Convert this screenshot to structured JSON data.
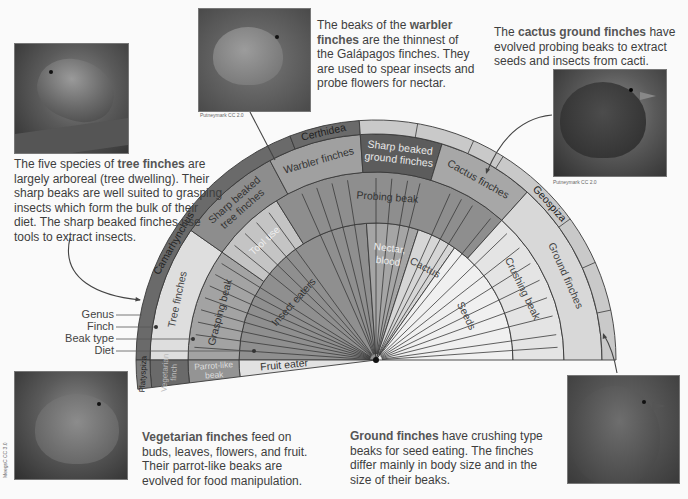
{
  "figure": {
    "center": {
      "x": 376,
      "y": 360
    },
    "rings": {
      "outer": 240,
      "genus_inner": 226,
      "finch_inner": 188,
      "beak_inner": 137
    },
    "legend": [
      {
        "label": "Genus"
      },
      {
        "label": "Finch"
      },
      {
        "label": "Beak type"
      },
      {
        "label": "Diet"
      }
    ],
    "genus": [
      {
        "label": "Camarhynchus",
        "start": 180,
        "end": 111,
        "shade": "#6a6a6a"
      },
      {
        "label": "Certhidea",
        "start": 111,
        "end": 94,
        "shade": "#6a6a6a"
      },
      {
        "label": "Geospiza",
        "start": 94,
        "end": 0,
        "shade": "#c9c9c9"
      }
    ],
    "finches": [
      {
        "label": "Tree finches",
        "start": 180,
        "end": 145,
        "shade": "#dedede",
        "text_color": "#444"
      },
      {
        "label": "Sharp beaked tree finches",
        "start": 145,
        "end": 118,
        "shade": "#8d8d8d",
        "text_color": "#333"
      },
      {
        "label": "Warbler finches",
        "start": 118,
        "end": 94,
        "shade": "#a0a0a0",
        "text_color": "#333"
      },
      {
        "label": "Sharp beaked ground finches",
        "start": 94,
        "end": 73,
        "shade": "#5c5c5c",
        "text_color": "#e8e8e8"
      },
      {
        "label": "Cactus finches",
        "start": 73,
        "end": 48,
        "shade": "#a7a7a7",
        "text_color": "#333"
      },
      {
        "label": "Ground finches",
        "start": 48,
        "end": 0,
        "shade": "#d8d8d8",
        "text_color": "#444"
      }
    ],
    "beaks": [
      {
        "label": "Grasping beak",
        "start": 180,
        "end": 145,
        "shade": "#a3a3a3",
        "text_color": "#333"
      },
      {
        "label": "Tool use",
        "start": 145,
        "end": 122,
        "shade": "#c4c4c4",
        "text_color": "#eee"
      },
      {
        "label": "Probing beak",
        "start": 122,
        "end": 48,
        "shade": "#8e8e8e",
        "text_color": "#333"
      },
      {
        "label": "Crushing beak",
        "start": 48,
        "end": 0,
        "shade": "#e4e4e4",
        "text_color": "#444"
      }
    ],
    "diets": [
      {
        "label": "Insect eaters",
        "start": 180,
        "end": 94,
        "shade": "#8f8f8f",
        "text_color": "#333"
      },
      {
        "label": "Nectar, blood",
        "start": 94,
        "end": 72,
        "shade": "#a5a5a5",
        "text_color": "#eee"
      },
      {
        "label": "Cactus",
        "start": 72,
        "end": 55,
        "shade": "#d6d6d6",
        "text_color": "#444"
      },
      {
        "label": "Seeds",
        "start": 55,
        "end": 0,
        "shade": "#f0f0f0",
        "text_color": "#444"
      }
    ],
    "lower_wedge": {
      "start": 180,
      "end": 187,
      "genus": {
        "label": "Platyspiza",
        "shade": "#7c7c7c"
      },
      "finch": {
        "label": "Vegetarian finch",
        "shade": "#6a6a6a"
      },
      "beak": {
        "label": "Parrot-like beak",
        "shade": "#949494"
      },
      "diet": {
        "label": "Fruit eater",
        "shade": "#e2e2e2"
      }
    }
  },
  "captions": {
    "tree": {
      "bold": "tree finches",
      "pre": "The five species of ",
      "post": " are largely arboreal (tree dwelling). Their sharp beaks are well suited to grasping insects which form the bulk of their diet. The sharp beaked finches use tools to extract insects."
    },
    "warbler": {
      "pre": "The beaks of the ",
      "bold": "warbler finches",
      "post": " are the thinnest of the Galápagos finches. They are used to spear insects and probe flowers for nectar."
    },
    "cactus": {
      "pre": "The ",
      "bold": "cactus ground finches",
      "post": " have evolved probing beaks to extract seeds and insects from cacti."
    },
    "vegetarian": {
      "bold": "Vegetarian finches",
      "post": " feed on buds, leaves, flowers, and fruit. Their parrot-like beaks are evolved for food manipulation."
    },
    "ground": {
      "bold": "Ground finches",
      "post": " have crushing type beaks for seed eating. The finches differ mainly in body size and in the size of their beaks."
    }
  },
  "credits": {
    "warbler": "Putneymark CC 2.0",
    "cactus": "Putneymark CC 2.0",
    "vegetarian": "MeegsC CC 3.0"
  },
  "photos": {
    "tree": {
      "alt": "Tree finch photo"
    },
    "warbler": {
      "alt": "Warbler finch photo"
    },
    "cactus": {
      "alt": "Cactus ground finch photo"
    },
    "vegetarian": {
      "alt": "Vegetarian finch photo"
    },
    "ground": {
      "alt": "Ground finch photo"
    }
  }
}
